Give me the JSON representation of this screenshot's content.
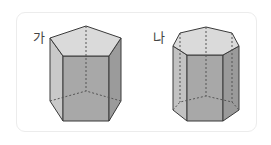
{
  "figures": [
    {
      "label": "가",
      "shape": "pentagonal-prism"
    },
    {
      "label": "나",
      "shape": "heptagonal-prism"
    }
  ],
  "colors": {
    "top_face": "#d9d9d9",
    "front_face": "#a9a9a9",
    "side_face_light": "#c8c8c8",
    "side_face_dark": "#9a9a9a",
    "edge": "#3a3a3a",
    "card_border": "#ececec"
  }
}
